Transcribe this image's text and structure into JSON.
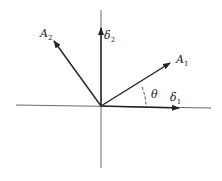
{
  "diagram": {
    "labels": {
      "A2": {
        "main": "A",
        "sub": "2"
      },
      "delta2": {
        "main": "δ",
        "sub": "2"
      },
      "A1": {
        "main": "A",
        "sub": "1"
      },
      "delta1": {
        "main": "δ",
        "sub": "1"
      },
      "theta": {
        "main": "θ"
      }
    },
    "colors": {
      "line": "#333333",
      "background": "#ffffff"
    }
  }
}
